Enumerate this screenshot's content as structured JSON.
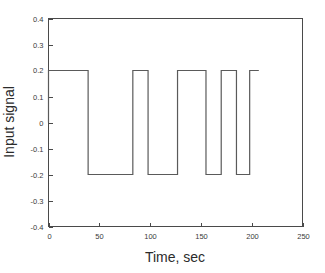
{
  "chart_data": {
    "type": "line",
    "title": "",
    "xlabel": "Time, sec",
    "ylabel": "Input signal",
    "xlim": [
      0,
      250
    ],
    "ylim": [
      -0.4,
      0.4
    ],
    "xticks": [
      0,
      50,
      100,
      150,
      200,
      250
    ],
    "xtick_labels": [
      "0",
      "50",
      "100",
      "150",
      "200",
      "250"
    ],
    "yticks": [
      -0.4,
      -0.3,
      -0.2,
      -0.1,
      0,
      0.1,
      0.2,
      0.3,
      0.4
    ],
    "ytick_labels": [
      "-0.4",
      "-0.3",
      "-0.2",
      "-0.1",
      "0",
      "0.1",
      "0.2",
      "0.3",
      "0.4"
    ],
    "grid": false,
    "legend": null,
    "high_level": 0.2,
    "low_level": -0.2,
    "line_color": "#5a5a5a",
    "series": [
      {
        "name": "Input signal",
        "waveform": "square",
        "x": [
          0,
          0,
          39,
          39,
          83,
          83,
          98,
          98,
          127,
          127,
          155,
          155,
          170,
          170,
          185,
          185,
          198,
          198,
          207
        ],
        "y": [
          0,
          0.2,
          0.2,
          -0.2,
          -0.2,
          0.2,
          0.2,
          -0.2,
          -0.2,
          0.2,
          0.2,
          -0.2,
          -0.2,
          0.2,
          0.2,
          -0.2,
          -0.2,
          0.2,
          0.2
        ]
      }
    ],
    "transitions": [
      {
        "time": 0,
        "to": 0.2
      },
      {
        "time": 39,
        "to": -0.2
      },
      {
        "time": 83,
        "to": 0.2
      },
      {
        "time": 98,
        "to": -0.2
      },
      {
        "time": 127,
        "to": 0.2
      },
      {
        "time": 155,
        "to": -0.2
      },
      {
        "time": 170,
        "to": 0.2
      },
      {
        "time": 185,
        "to": -0.2
      },
      {
        "time": 198,
        "to": 0.2
      },
      {
        "time": 207,
        "to": 0.2
      }
    ]
  },
  "axes": {
    "x_title": "Time, sec",
    "y_title": "Input signal"
  }
}
